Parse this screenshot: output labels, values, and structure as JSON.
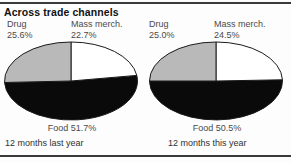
{
  "title": "Across trade channels",
  "colors": {
    "drug_slice": "#b9b9b9",
    "mass_slice": "#ffffff",
    "food_slice": "#0a0a0a",
    "outline": "#1a1a1a",
    "label_text": "#4a4a4a",
    "title_text": "#121212",
    "rule": "#3a3a3a",
    "background": "#fdfdfd"
  },
  "panels": [
    {
      "id": "last-year",
      "period_label": "12 months last year",
      "drug": {
        "category": "Drug",
        "percent": "25.6%"
      },
      "mass": {
        "category": "Mass merch.",
        "percent": "22.7%"
      },
      "food": {
        "label": "Food 51.7%"
      }
    },
    {
      "id": "this-year",
      "period_label": "12 months this year",
      "drug": {
        "category": "Drug",
        "percent": "25.0%"
      },
      "mass": {
        "category": "Mass merch.",
        "percent": "24.5%"
      },
      "food": {
        "label": "Food 50.5%"
      }
    }
  ],
  "chart_data": [
    {
      "type": "pie",
      "title": "12 months last year",
      "categories": [
        "Drug",
        "Mass merch.",
        "Food"
      ],
      "values": [
        25.6,
        22.7,
        51.7
      ],
      "unit": "percent",
      "colors": [
        "#b9b9b9",
        "#ffffff",
        "#0a0a0a"
      ],
      "start_angle_deg": 0,
      "direction": "counterclockwise",
      "legend": "inline-callouts",
      "grid": false
    },
    {
      "type": "pie",
      "title": "12 months this year",
      "categories": [
        "Drug",
        "Mass merch.",
        "Food"
      ],
      "values": [
        25.0,
        24.5,
        50.5
      ],
      "unit": "percent",
      "colors": [
        "#b9b9b9",
        "#ffffff",
        "#0a0a0a"
      ],
      "start_angle_deg": 0,
      "direction": "counterclockwise",
      "legend": "inline-callouts",
      "grid": false
    }
  ]
}
